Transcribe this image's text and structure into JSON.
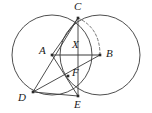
{
  "figure": {
    "width": 152,
    "height": 113,
    "background_color": "#ffffff",
    "stroke_color": "#3a3a3a",
    "label_color": "#1a1a1a",
    "dash_color": "#6a6a6a"
  },
  "points": [
    {
      "name": "C",
      "label": "C",
      "x": 78,
      "y": 18,
      "label_x": 74,
      "label_y": 2,
      "marked": true
    },
    {
      "name": "A",
      "label": "A",
      "x": 52,
      "y": 55,
      "label_x": 39,
      "label_y": 45,
      "marked": true
    },
    {
      "name": "B",
      "label": "B",
      "x": 100,
      "y": 55,
      "label_x": 106,
      "label_y": 48,
      "marked": true
    },
    {
      "name": "X",
      "label": "X",
      "x": 76,
      "y": 55,
      "label_x": 72,
      "label_y": 39,
      "marked": false
    },
    {
      "name": "F",
      "label": "F",
      "x": 68,
      "y": 76,
      "label_x": 72,
      "label_y": 68,
      "marked": true
    },
    {
      "name": "D",
      "label": "D",
      "x": 33,
      "y": 92,
      "label_x": 18,
      "label_y": 92,
      "marked": true
    },
    {
      "name": "E",
      "label": "E",
      "x": 78,
      "y": 96,
      "label_x": 74,
      "label_y": 99,
      "marked": true
    }
  ],
  "circles": [
    {
      "name": "left-circle",
      "cx": 52,
      "cy": 55,
      "r": 40
    },
    {
      "name": "right-circle",
      "cx": 100,
      "cy": 55,
      "r": 40
    }
  ],
  "segments": [
    {
      "name": "segment-AB",
      "from": "A",
      "to": "B",
      "style": "solid"
    },
    {
      "name": "segment-CA",
      "from": "C",
      "to": "A",
      "style": "solid"
    },
    {
      "name": "segment-CD",
      "from": "C",
      "to": "D",
      "style": "solid"
    },
    {
      "name": "segment-CE",
      "from": "C",
      "to": "E",
      "style": "solid"
    },
    {
      "name": "segment-AE",
      "from": "A",
      "to": "E",
      "style": "solid"
    },
    {
      "name": "segment-DB",
      "from": "D",
      "to": "B",
      "style": "solid"
    },
    {
      "name": "segment-DE",
      "from": "D",
      "to": "E",
      "style": "solid"
    }
  ],
  "arcs": [
    {
      "name": "dashed-arc-CB",
      "from": "C",
      "to": "B",
      "style": "dashed",
      "sweep": "bulge-right"
    }
  ]
}
